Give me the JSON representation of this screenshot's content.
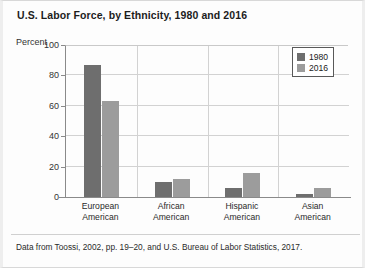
{
  "figure": {
    "title": "U.S. Labor Force, by Ethnicity, 1980 and 2016",
    "source_note": "Data from Toossi, 2002, pp. 19–20, and U.S. Bureau of Labor Statistics, 2017."
  },
  "colors": {
    "series_1980": "#6e6e6e",
    "series_2016": "#9c9c9c",
    "axis": "#8a8a8a",
    "grid": "#d2d2d2"
  },
  "chart_data": {
    "type": "bar",
    "title": "U.S. Labor Force, by Ethnicity, 1980 and 2016",
    "xlabel": "",
    "ylabel": "Percent",
    "ylim": [
      0,
      100
    ],
    "yticks": [
      0,
      20,
      40,
      60,
      80,
      100
    ],
    "grid": true,
    "legend_position": "top-right",
    "categories": [
      "European American",
      "African American",
      "Hispanic American",
      "Asian American"
    ],
    "category_lines": [
      [
        "European",
        "American"
      ],
      [
        "African",
        "American"
      ],
      [
        "Hispanic",
        "American"
      ],
      [
        "Asian",
        "American"
      ]
    ],
    "series": [
      {
        "name": "1980",
        "values": [
          87,
          10,
          6,
          2
        ]
      },
      {
        "name": "2016",
        "values": [
          63,
          12,
          16,
          6
        ]
      }
    ]
  }
}
